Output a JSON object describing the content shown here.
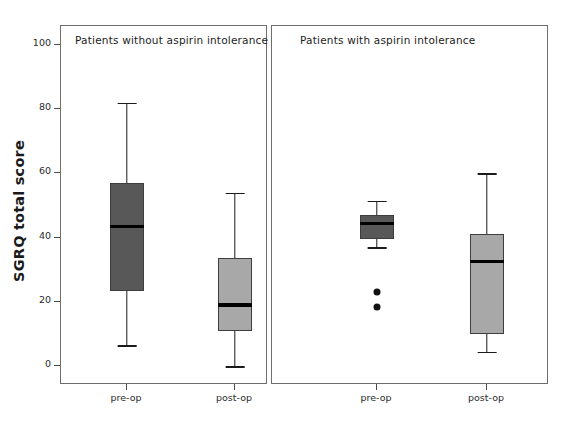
{
  "chart_data": {
    "type": "box",
    "title": "",
    "xlabel": "",
    "ylabel": "SGRQ total score",
    "ylim": [
      0,
      100
    ],
    "yticks": [
      0,
      20,
      40,
      60,
      80,
      100
    ],
    "ytick_labels": [
      "0",
      "20",
      "40",
      "60",
      "80",
      "100"
    ],
    "grid": false,
    "legend": "none",
    "categories": [
      "pre-op",
      "post-op"
    ],
    "panels": [
      {
        "title": "Patients without aspirin intolerance",
        "boxes": [
          {
            "label": "pre-op",
            "fill_color": "#585858",
            "whisker_low": 6.5,
            "q1": 23.5,
            "median": 43.5,
            "q3": 57.0,
            "whisker_high": 82.0,
            "outliers": []
          },
          {
            "label": "post-op",
            "fill_color": "#a8a8a8",
            "whisker_low": 0.0,
            "q1": 11.0,
            "median": 19.0,
            "q3": 33.5,
            "whisker_high": 54.0,
            "outliers": []
          }
        ]
      },
      {
        "title": "Patients with aspirin intolerance",
        "boxes": [
          {
            "label": "pre-op",
            "fill_color": "#585858",
            "whisker_low": 37.0,
            "q1": 39.5,
            "median": 44.5,
            "q3": 47.0,
            "whisker_high": 51.5,
            "outliers": [
              23.0,
              18.5
            ]
          },
          {
            "label": "post-op",
            "fill_color": "#a8a8a8",
            "whisker_low": 4.5,
            "q1": 10.0,
            "median": 32.5,
            "q3": 41.0,
            "whisker_high": 60.0,
            "outliers": []
          }
        ]
      }
    ]
  },
  "axis": {
    "y_title": "SGRQ total score"
  },
  "colors": {
    "dark_box": "#585858",
    "light_box": "#a8a8a8",
    "frame": "#6e6e6e",
    "median": "#000000",
    "background": "#ffffff"
  }
}
